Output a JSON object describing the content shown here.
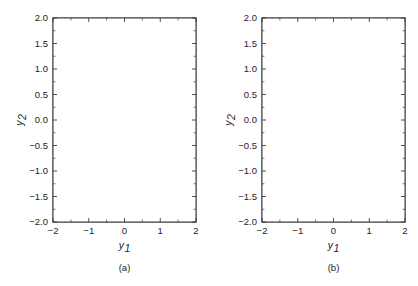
{
  "figure": {
    "background": "#ffffff",
    "line_color": "#2e2e2e",
    "frame_color": "#3b3b3b",
    "text_color": "#242424"
  },
  "chart_data": [
    {
      "type": "line",
      "name": "phase-portrait-a",
      "title": "",
      "caption": "(a)",
      "xlabel": "y",
      "xlabel_sub": "1",
      "ylabel": "y",
      "ylabel_sub": "2",
      "xlim": [
        -2,
        2
      ],
      "ylim": [
        -2,
        2
      ],
      "xticks": [
        -2,
        -1,
        0,
        1,
        2
      ],
      "xticklabels": [
        "−2",
        "−1",
        "0",
        "1",
        "2"
      ],
      "yticks": [
        -2.0,
        -1.5,
        -1.0,
        -0.5,
        0.0,
        0.5,
        1.0,
        1.5,
        2.0
      ],
      "yticklabels": [
        "−2.0",
        "−1.5",
        "−1.0",
        "−0.5",
        "0.0",
        "0.5",
        "1.0",
        "1.5",
        "2.0"
      ],
      "grid": false,
      "legend": "none",
      "field_kind": "improper-node-source",
      "matrix": [
        [
          1.0,
          0.25
        ],
        [
          0.0,
          1.0
        ]
      ],
      "direction": "outward",
      "streamline_count": 46,
      "arrow_count_per_line": 2
    },
    {
      "type": "line",
      "name": "phase-portrait-b",
      "title": "",
      "caption": "(b)",
      "xlabel": "y",
      "xlabel_sub": "1",
      "ylabel": "y",
      "ylabel_sub": "2",
      "xlim": [
        -2,
        2
      ],
      "ylim": [
        -2,
        2
      ],
      "xticks": [
        -2,
        -1,
        0,
        1,
        2
      ],
      "xticklabels": [
        "−2",
        "−1",
        "0",
        "1",
        "2"
      ],
      "yticks": [
        -2.0,
        -1.5,
        -1.0,
        -0.5,
        0.0,
        0.5,
        1.0,
        1.5,
        2.0
      ],
      "yticklabels": [
        "−2.0",
        "−1.5",
        "−1.0",
        "−0.5",
        "0.0",
        "0.5",
        "1.0",
        "1.5",
        "2.0"
      ],
      "grid": false,
      "legend": "none",
      "field_kind": "spiral-source",
      "matrix": [
        [
          0.28,
          1.0
        ],
        [
          -1.0,
          0.28
        ]
      ],
      "direction": "outward",
      "streamline_count": 44,
      "arrow_count_per_line": 2
    }
  ]
}
